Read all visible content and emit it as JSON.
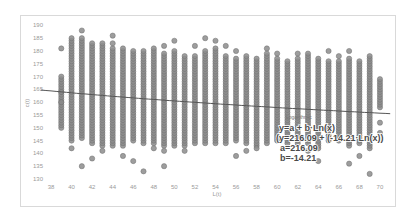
{
  "chart_data": {
    "type": "scatter",
    "title": "",
    "xlabel": "L(t)",
    "ylabel": "c(t)",
    "xlim": [
      37,
      71
    ],
    "ylim": [
      128,
      191
    ],
    "x_ticks": [
      38,
      40,
      42,
      44,
      46,
      48,
      50,
      52,
      54,
      56,
      58,
      60,
      62,
      64,
      66,
      68,
      70
    ],
    "y_ticks": [
      130,
      135,
      140,
      145,
      150,
      155,
      160,
      165,
      170,
      175,
      180,
      185,
      190
    ],
    "grid": false,
    "marker_color": "#8c8c8c",
    "columns": [
      {
        "x": 39,
        "min": 150,
        "max": 170,
        "outliers": [
          181,
          164,
          160
        ]
      },
      {
        "x": 40,
        "min": 145,
        "max": 185,
        "outliers": [
          142
        ]
      },
      {
        "x": 41,
        "min": 146,
        "max": 185,
        "outliers": [
          188,
          135
        ]
      },
      {
        "x": 42,
        "min": 144,
        "max": 183,
        "outliers": [
          138
        ]
      },
      {
        "x": 43,
        "min": 143,
        "max": 183,
        "outliers": [
          141
        ]
      },
      {
        "x": 44,
        "min": 143,
        "max": 181,
        "outliers": [
          186,
          183
        ]
      },
      {
        "x": 45,
        "min": 143,
        "max": 181,
        "outliers": [
          139
        ]
      },
      {
        "x": 46,
        "min": 145,
        "max": 180,
        "outliers": [
          137
        ]
      },
      {
        "x": 47,
        "min": 144,
        "max": 180,
        "outliers": [
          133
        ]
      },
      {
        "x": 48,
        "min": 144,
        "max": 181,
        "outliers": [
          142
        ]
      },
      {
        "x": 49,
        "min": 143,
        "max": 179,
        "outliers": [
          182,
          135,
          141
        ]
      },
      {
        "x": 50,
        "min": 143,
        "max": 180,
        "outliers": [
          184
        ]
      },
      {
        "x": 51,
        "min": 143,
        "max": 178,
        "outliers": [
          141
        ]
      },
      {
        "x": 52,
        "min": 144,
        "max": 178,
        "outliers": [
          182
        ]
      },
      {
        "x": 53,
        "min": 144,
        "max": 180,
        "outliers": [
          185
        ]
      },
      {
        "x": 54,
        "min": 144,
        "max": 181,
        "outliers": [
          184
        ]
      },
      {
        "x": 55,
        "min": 144,
        "max": 178,
        "outliers": [
          182
        ]
      },
      {
        "x": 56,
        "min": 145,
        "max": 177,
        "outliers": [
          180,
          139
        ]
      },
      {
        "x": 57,
        "min": 144,
        "max": 178,
        "outliers": [
          141
        ]
      },
      {
        "x": 58,
        "min": 143,
        "max": 177,
        "outliers": [
          142
        ]
      },
      {
        "x": 59,
        "min": 144,
        "max": 179,
        "outliers": [
          181
        ]
      },
      {
        "x": 60,
        "min": 145,
        "max": 177,
        "outliers": [
          179
        ]
      },
      {
        "x": 61,
        "min": 144,
        "max": 176,
        "outliers": []
      },
      {
        "x": 62,
        "min": 144,
        "max": 177,
        "outliers": [
          179
        ]
      },
      {
        "x": 63,
        "min": 144,
        "max": 179,
        "outliers": [
          141
        ]
      },
      {
        "x": 64,
        "min": 142,
        "max": 177,
        "outliers": [
          137
        ]
      },
      {
        "x": 65,
        "min": 145,
        "max": 176,
        "outliers": [
          180
        ]
      },
      {
        "x": 66,
        "min": 145,
        "max": 176,
        "outliers": [
          178
        ]
      },
      {
        "x": 67,
        "min": 143,
        "max": 177,
        "outliers": [
          180,
          136
        ]
      },
      {
        "x": 68,
        "min": 144,
        "max": 176,
        "outliers": [
          139
        ]
      },
      {
        "x": 69,
        "min": 142,
        "max": 178,
        "outliers": [
          132
        ]
      },
      {
        "x": 70,
        "min": 158,
        "max": 169,
        "outliers": [
          152,
          148
        ]
      }
    ],
    "trendline": {
      "type": "logarithmic",
      "equation_form": "y=a + b·Ln(x)",
      "a": 216.09,
      "b": -14.21,
      "color": "#555555"
    },
    "annotation": {
      "title": "Logarithmic",
      "line1": "y=a + b·Ln(x)",
      "line2": "(y=216.09 + (-14.21·Ln(x))",
      "line3": "a=216.09",
      "line4": "b=-14.21"
    }
  }
}
